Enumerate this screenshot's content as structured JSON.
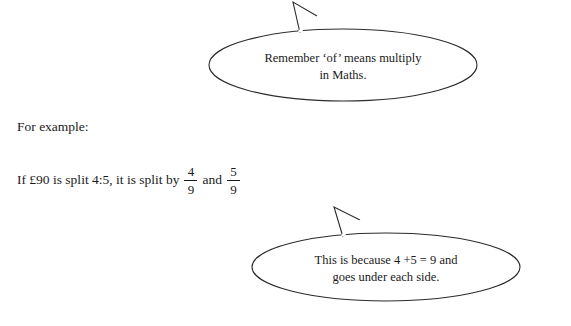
{
  "document": {
    "bubbles": [
      {
        "name": "remember-bubble",
        "line1": "Remember ‘of’ means multiply",
        "line2": "in Maths."
      },
      {
        "name": "because-bubble",
        "line1": "This is because 4 +5 = 9 and",
        "line2": "goes under each side."
      }
    ],
    "body": {
      "example_label": "For example:",
      "split_sentence": {
        "before": "If £90 is split 4:5, it is split by",
        "fraction1": {
          "numerator": "4",
          "denominator": "9"
        },
        "conjunction": "and",
        "fraction2": {
          "numerator": "5",
          "denominator": "9"
        }
      }
    },
    "colors": {
      "ink": "#1a1a1a",
      "background": "#ffffff",
      "outline": "#2b2b2b"
    }
  }
}
